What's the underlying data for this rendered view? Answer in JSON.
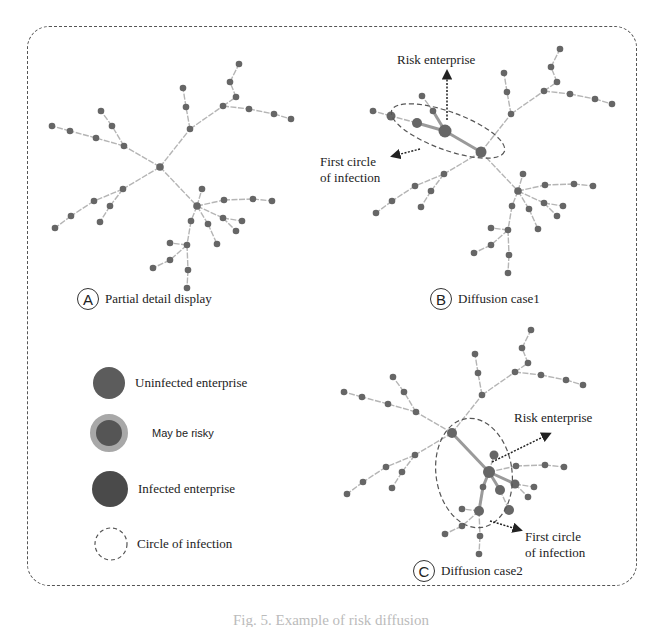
{
  "figure": {
    "caption": "Fig. 5. Example of risk diffusion"
  },
  "panels": [
    {
      "letter": "A",
      "label": "Partial detail display"
    },
    {
      "letter": "B",
      "label": "Diffusion case1",
      "annotations": {
        "risk": "Risk enterprise",
        "circle_line1": "First circle",
        "circle_line2": "of infection"
      }
    },
    {
      "letter": "C",
      "label": "Diffusion case2",
      "annotations": {
        "risk": "Risk enterprise",
        "circle_line1": "First circle",
        "circle_line2": "of infection"
      }
    }
  ],
  "legend": [
    {
      "label": "Uninfected enterprise",
      "color": "#5a5a5a"
    },
    {
      "label": "May be risky",
      "color": "#555555",
      "ring": "#a8a8a8"
    },
    {
      "label": "Infected enterprise",
      "color": "#4a4a4a"
    },
    {
      "label": "Circle of infection",
      "style": "dashed"
    }
  ],
  "colors": {
    "node": "#666666",
    "edge": "#b5b5b5",
    "highlight_edge": "#9a9a9a",
    "frame": "#555555"
  }
}
